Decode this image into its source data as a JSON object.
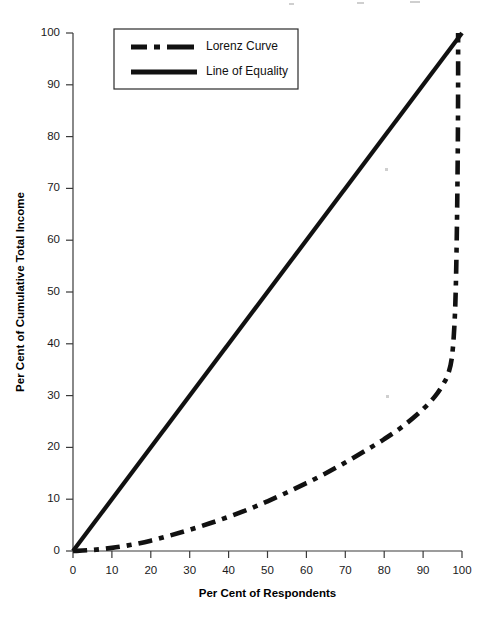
{
  "chart_data": {
    "type": "line",
    "title": "",
    "xlabel": "Per Cent of Respondents",
    "ylabel": "Per Cent of Cumulative Total Income",
    "xlim": [
      0,
      100
    ],
    "ylim": [
      0,
      100
    ],
    "xticks": [
      "0",
      "10",
      "20",
      "30",
      "40",
      "50",
      "60",
      "70",
      "80",
      "90",
      "100"
    ],
    "yticks": [
      "0",
      "10",
      "20",
      "30",
      "40",
      "50",
      "60",
      "70",
      "80",
      "90",
      "100"
    ],
    "grid": false,
    "legend_position": "upper-left-inside",
    "series": [
      {
        "name": "Lorenz Curve",
        "style": "dash-dot",
        "color": "#111111",
        "x": [
          0,
          5,
          10,
          15,
          20,
          25,
          30,
          35,
          40,
          45,
          50,
          55,
          60,
          65,
          70,
          75,
          80,
          85,
          90,
          93,
          95,
          96.5,
          97.5,
          98.2,
          98.6,
          98.9,
          99.0,
          99.0
        ],
        "values": [
          0,
          0.2,
          0.6,
          1.2,
          2.0,
          3.0,
          4.1,
          5.3,
          6.6,
          8.0,
          9.6,
          11.3,
          13.1,
          15.0,
          17.1,
          19.3,
          21.6,
          24.2,
          27.4,
          29.8,
          32.0,
          34.3,
          38.0,
          46.0,
          58.0,
          76.0,
          90.0,
          100.0
        ]
      },
      {
        "name": "Line of Equality",
        "style": "solid",
        "color": "#111111",
        "x": [
          0,
          100
        ],
        "values": [
          0,
          100
        ]
      }
    ]
  },
  "legend": {
    "items": [
      {
        "label": "Lorenz Curve",
        "style": "dash-dot"
      },
      {
        "label": "Line of Equality",
        "style": "solid"
      }
    ]
  },
  "axes": {
    "x_title": "Per Cent of Respondents",
    "y_title": "Per Cent of Cumulative Total Income"
  }
}
